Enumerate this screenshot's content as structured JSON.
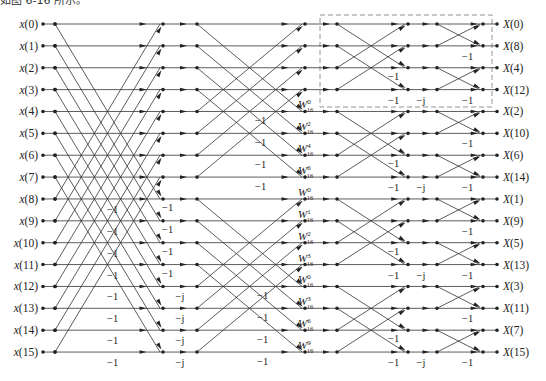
{
  "caption_partial": "如图 6-16 所示。",
  "diagram": {
    "colors": {
      "line": "#333333",
      "node": "#222222",
      "dashed_box": "#888888"
    },
    "rows_y_start": 24,
    "rows_y_step": 21.87,
    "columns": {
      "in_dot": 43,
      "in_node": 55,
      "s1_end": 163,
      "s2_start": 197,
      "s2_end": 305,
      "s3_start": 337,
      "s3_end": 408,
      "s4_start": 437,
      "s4_end": 483,
      "out_dot": 497
    },
    "inputs": [
      "x(0)",
      "x(1)",
      "x(2)",
      "x(3)",
      "x(4)",
      "x(5)",
      "x(6)",
      "x(7)",
      "x(8)",
      "x(9)",
      "x(10)",
      "x(11)",
      "x(12)",
      "x(13)",
      "x(14)",
      "x(15)"
    ],
    "outputs": [
      "X(0)",
      "X(8)",
      "X(4)",
      "X(12)",
      "X(2)",
      "X(10)",
      "X(6)",
      "X(14)",
      "X(1)",
      "X(9)",
      "X(5)",
      "X(13)",
      "X(3)",
      "X(11)",
      "X(7)",
      "X(15)"
    ],
    "stage1": {
      "span": 8,
      "minus_one_rows": [
        8,
        9,
        10,
        11,
        12,
        13,
        14,
        15
      ],
      "minus_one_x": 107,
      "neg_j_rows": [],
      "twiddle_between": {
        "rows": [
          12,
          13,
          14,
          15
        ],
        "label": "-j",
        "x": 180
      }
    },
    "stage2": {
      "span": 4,
      "minus_one_rows": [
        4,
        5,
        6,
        7,
        12,
        13,
        14,
        15
      ],
      "minus_one_x": 260,
      "upper_minus_x": 262
    },
    "w_labels": {
      "x": 298,
      "rows": [
        4,
        5,
        6,
        7,
        8,
        9,
        10,
        11,
        12,
        13,
        14,
        15
      ],
      "upper_rows_offset": -1,
      "exponents": [
        "0",
        "2",
        "4",
        "6",
        "0",
        "1",
        "2",
        "3",
        "0",
        "3",
        "6",
        "9"
      ],
      "subscript": "16",
      "base": "W"
    },
    "stage3": {
      "span": 2,
      "minus_one_rows": [
        2,
        3,
        6,
        7,
        10,
        11,
        14,
        15
      ],
      "minus_one_x": 388,
      "neg_j": {
        "rows": [
          3,
          7,
          11,
          15
        ],
        "label": "−j",
        "x": 421
      }
    },
    "stage4": {
      "span": 1,
      "minus_one_rows": [
        1,
        3,
        5,
        7,
        9,
        11,
        13,
        15
      ],
      "minus_one_x": 462
    },
    "labels": {
      "minus_one": "−1",
      "neg_j": "−j"
    },
    "dashed_box": {
      "x": 320,
      "y": 15,
      "w": 172,
      "h": 92
    }
  }
}
